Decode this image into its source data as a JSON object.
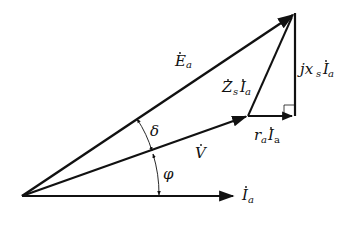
{
  "diagram": {
    "type": "phasor-diagram",
    "colors": {
      "line": "#111111",
      "background": "#ffffff"
    },
    "origin": [
      22,
      196
    ],
    "phasors": [
      {
        "id": "Ea",
        "symbol": "E",
        "subscript": "a",
        "dot": true,
        "from": [
          22,
          196
        ],
        "to": [
          295,
          13
        ]
      },
      {
        "id": "V",
        "symbol": "V",
        "subscript": "",
        "dot": true,
        "from": [
          22,
          196
        ],
        "to": [
          248,
          116
        ]
      },
      {
        "id": "Ia",
        "symbol": "I",
        "subscript": "a",
        "dot": true,
        "from": [
          22,
          196
        ],
        "to": [
          235,
          196
        ]
      },
      {
        "id": "raIa",
        "text": "r",
        "subscript": "a",
        "symbol2": "I",
        "subscript2": "a",
        "from": [
          248,
          116
        ],
        "to": [
          295,
          116
        ]
      },
      {
        "id": "jxsIa",
        "text": "jx",
        "subscript": "s",
        "symbol2": "I",
        "subscript2": "a",
        "from": [
          295,
          116
        ],
        "to": [
          295,
          13
        ]
      },
      {
        "id": "ZsIa",
        "symbol": "Z",
        "subscript": "s",
        "symbol2": "I",
        "subscript2": "a",
        "from": [
          248,
          116
        ],
        "to": [
          295,
          13
        ]
      }
    ],
    "angles": [
      {
        "name": "delta",
        "symbol": "δ",
        "between": [
          "V",
          "Ea"
        ]
      },
      {
        "name": "phi",
        "symbol": "φ",
        "between": [
          "Ia",
          "V"
        ]
      }
    ],
    "labels": {
      "Ea": {
        "main": "E",
        "sub": "a"
      },
      "V": {
        "main": "V"
      },
      "Ia": {
        "main": "I",
        "sub": "a"
      },
      "ZsIa": {
        "main1": "Z",
        "sub1": "s",
        "main2": "I",
        "sub2": "a"
      },
      "jxsIa": {
        "prefix": "jx",
        "sub1": "s",
        "main2": "I",
        "sub2": "a"
      },
      "raIa": {
        "prefix": "r",
        "sub1": "a",
        "main2": "I",
        "sub2": "a"
      },
      "delta": "δ",
      "phi": "φ"
    },
    "right_angle_marker": true
  }
}
